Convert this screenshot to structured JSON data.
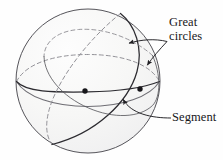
{
  "figure": {
    "kind": "geometry-diagram",
    "background_color": "#fefefe",
    "sphere": {
      "center_x": 88,
      "center_y": 81,
      "radius": 72,
      "fill_color": "#f6f6f5",
      "outline_color": "#55545a",
      "outline_width": 1.0,
      "shading_highlight_color": "#fcfcfc"
    },
    "curve_colors": {
      "solid_stroke": "#2c2b30",
      "faint_solid_stroke": "#6f6e74",
      "dashed_stroke": "#8d8c92",
      "leader_stroke": "#1f1e22",
      "point_fill": "#17161a"
    },
    "stroke_widths": {
      "great_circle_solid": 1.25,
      "great_circle_faint": 1.0,
      "great_circle_dashed": 0.95,
      "leader": 0.95
    },
    "dash_pattern": "4,3",
    "points": [
      {
        "name": "segment-endpoint-left",
        "x": 85,
        "y": 91
      },
      {
        "name": "segment-endpoint-right",
        "x": 140,
        "y": 89
      }
    ],
    "great_circles": [
      {
        "name": "equatorial-great-circle",
        "front_visible": true,
        "back_dashed": true
      },
      {
        "name": "tilted-great-circle",
        "front_visible": true,
        "back_dashed": true
      }
    ]
  },
  "labels": {
    "great_circles": {
      "line1": "Great",
      "line2": "circles"
    },
    "segment": "Segment"
  },
  "leaders": [
    {
      "name": "leader-great-circle-solid",
      "from_x": 167,
      "from_y": 41,
      "to_x": 126,
      "to_y": 44,
      "arrowhead": true
    },
    {
      "name": "leader-great-circle-dashed",
      "from_x": 167,
      "from_y": 41,
      "to_x": 146,
      "to_y": 67,
      "arrowhead": true
    },
    {
      "name": "leader-segment",
      "from_x": 170,
      "from_y": 118,
      "to_x": 122,
      "to_y": 96,
      "arrowhead": true
    }
  ]
}
